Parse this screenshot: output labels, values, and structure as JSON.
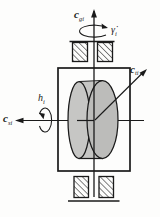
{
  "figure": {
    "kind": "single-gimbal control moment gyro schematic",
    "colors": {
      "line": "#1a1a1a",
      "hatch": "#2a2a2a",
      "rotor_body": "#c6c6c4",
      "rotor_face": "#bcbcba",
      "background": "#fdfdfc"
    },
    "labels": {
      "gimbal_axis": {
        "base": "c",
        "sub": "gi"
      },
      "gimbal_rate": {
        "base": "γ̇",
        "sub": "i"
      },
      "spin_axis": {
        "base": "c",
        "sub": "si"
      },
      "momentum": {
        "base": "h",
        "sub": "i"
      },
      "transverse_axis": {
        "base": "c",
        "sub": "ti"
      }
    }
  }
}
